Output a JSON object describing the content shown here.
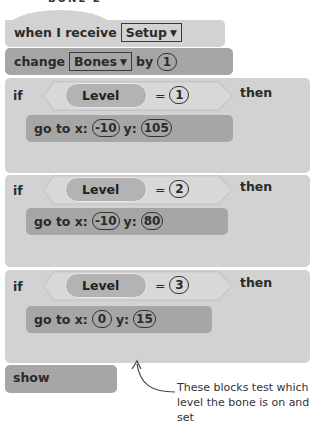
{
  "title": "BONE 2",
  "colors": {
    "block_light": "#d2d2d2",
    "block_dark": "#a6a6a6",
    "condition": "#c6c6c6",
    "reporter": "#b3b3b3"
  },
  "script": {
    "hat": {
      "text": "when I receive",
      "dropdown": "Setup"
    },
    "change": {
      "text": "change",
      "dropdown": "Bones",
      "by_label": "by",
      "value": "1"
    },
    "if_blocks": [
      {
        "if_label": "if",
        "variable": "Level",
        "operator": "=",
        "value": "1",
        "then_label": "then",
        "goto": {
          "label_x": "go to x:",
          "x": "-10",
          "label_y": "y:",
          "y": "105"
        }
      },
      {
        "if_label": "if",
        "variable": "Level",
        "operator": "=",
        "value": "2",
        "then_label": "then",
        "goto": {
          "label_x": "go to x:",
          "x": "-10",
          "label_y": "y:",
          "y": "80"
        }
      },
      {
        "if_label": "if",
        "variable": "Level",
        "operator": "=",
        "value": "3",
        "then_label": "then",
        "goto": {
          "label_x": "go to x:",
          "x": "0",
          "label_y": "y:",
          "y": "15"
        }
      }
    ],
    "show": {
      "text": "show"
    }
  },
  "annotation": {
    "line1": "These blocks test which",
    "line2": "level the bone is on and set"
  }
}
